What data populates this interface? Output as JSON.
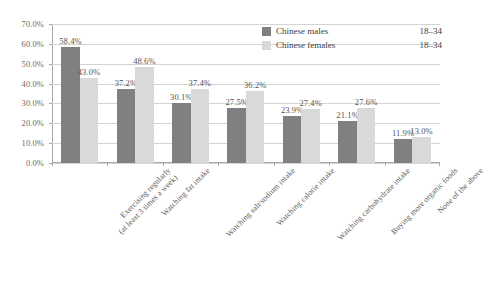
{
  "chart_data": {
    "type": "bar",
    "title": "",
    "xlabel": "",
    "ylabel": "",
    "ylim": [
      0,
      70
    ],
    "ytick_step": 10,
    "ytick_labels": [
      "0.0%",
      "10.0%",
      "20.0%",
      "30.0%",
      "40.0%",
      "50.0%",
      "60.0%",
      "70.0%"
    ],
    "grid": true,
    "legend_position": "top-right",
    "value_suffix": "%",
    "categories": [
      "Exercising regularly (at least 3 times a week)",
      "Watching fat intake",
      "Watching salt/sodium intake",
      "Watching calorie intake",
      "Watching carbohydrate intake",
      "Buying more organic foods",
      "None of the above"
    ],
    "category_lines": [
      [
        "Exercising regularly",
        "(at least 3 times a week)"
      ],
      [
        "Watching fat intake",
        ""
      ],
      [
        "Watching salt/sodium intake",
        ""
      ],
      [
        "Watching calorie intake",
        ""
      ],
      [
        "Watching carbohydrate intake",
        ""
      ],
      [
        "Buying more organic foods",
        ""
      ],
      [
        "None of the above",
        ""
      ]
    ],
    "series": [
      {
        "name": "Chinese males",
        "age": "18–34",
        "color": "#808080",
        "values": [
          58.4,
          37.2,
          30.1,
          27.5,
          23.9,
          21.1,
          11.9
        ],
        "labels": [
          "58.4%",
          "37.2%",
          "30.1%",
          "27.5%",
          "23.9%",
          "21.1%",
          "11.9%"
        ]
      },
      {
        "name": "Chinese females",
        "age": "18–34",
        "color": "#d9d9d9",
        "values": [
          43.0,
          48.6,
          37.4,
          36.2,
          27.4,
          27.6,
          13.0
        ],
        "labels": [
          "43.0%",
          "48.6%",
          "37.4%",
          "36.2%",
          "27.4%",
          "27.6%",
          "13.0%"
        ]
      }
    ]
  }
}
